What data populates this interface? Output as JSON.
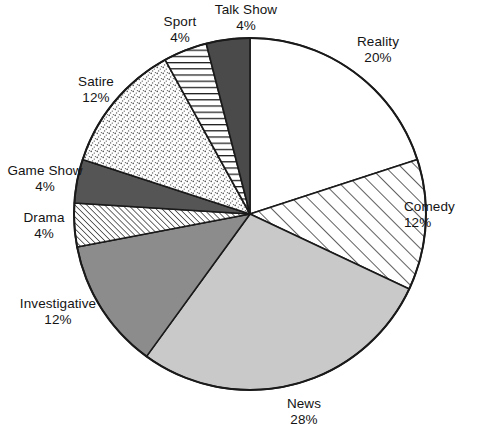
{
  "chart_data": {
    "type": "pie",
    "title": "",
    "subtitle": "",
    "xlabel": "",
    "ylabel": "",
    "legend_position": "none",
    "grid": false,
    "units": "%",
    "start_angle_deg": 0,
    "direction": "clockwise",
    "total": 100,
    "categories": [
      "Reality",
      "Comedy",
      "News",
      "Investigative",
      "Drama",
      "Game Show",
      "Satire",
      "Sport",
      "Talk Show"
    ],
    "values": [
      20,
      12,
      28,
      12,
      4,
      4,
      12,
      4,
      4
    ],
    "slices": [
      {
        "label": "Reality",
        "value": 20,
        "value_text": "20%",
        "fill": "#ffffff",
        "pattern": "solid-white",
        "start_deg": 0,
        "end_deg": 72
      },
      {
        "label": "Comedy",
        "value": 12,
        "value_text": "12%",
        "fill": "#ffffff",
        "pattern": "diagonal-hatch-wide",
        "start_deg": 72,
        "end_deg": 115.2
      },
      {
        "label": "News",
        "value": 28,
        "value_text": "28%",
        "fill": "#c9c9c9",
        "pattern": "solid-light-gray",
        "start_deg": 115.2,
        "end_deg": 216
      },
      {
        "label": "Investigative",
        "value": 12,
        "value_text": "12%",
        "fill": "#8c8c8c",
        "pattern": "solid-mid-gray",
        "start_deg": 216,
        "end_deg": 259.2
      },
      {
        "label": "Drama",
        "value": 4,
        "value_text": "4%",
        "fill": "#ffffff",
        "pattern": "diagonal-hatch-fine",
        "start_deg": 259.2,
        "end_deg": 273.6
      },
      {
        "label": "Game Show",
        "value": 4,
        "value_text": "4%",
        "fill": "#555555",
        "pattern": "solid-dark-gray",
        "start_deg": 273.6,
        "end_deg": 288
      },
      {
        "label": "Satire",
        "value": 12,
        "value_text": "12%",
        "fill": "#ffffff",
        "pattern": "stipple-dots",
        "start_deg": 288,
        "end_deg": 331.2
      },
      {
        "label": "Sport",
        "value": 4,
        "value_text": "4%",
        "fill": "#ffffff",
        "pattern": "horizontal-lines",
        "start_deg": 331.2,
        "end_deg": 345.6
      },
      {
        "label": "Talk Show",
        "value": 4,
        "value_text": "4%",
        "fill": "#4a4a4a",
        "pattern": "solid-dark-gray",
        "start_deg": 345.6,
        "end_deg": 360
      }
    ],
    "colors": {
      "outline": "#1a1a1a",
      "text": "#141414",
      "background": "#ffffff",
      "light_gray": "#c9c9c9",
      "mid_gray": "#8c8c8c",
      "dark_gray": "#555555",
      "darkest_gray": "#4a4a4a"
    },
    "geometry": {
      "center_x": 250,
      "center_y": 214,
      "radius": 176
    }
  },
  "labels": {
    "reality": {
      "name": "Reality",
      "value": "20%"
    },
    "comedy": {
      "name": "Comedy",
      "value": "12%"
    },
    "news": {
      "name": "News",
      "value": "28%"
    },
    "investigative": {
      "name": "Investigative",
      "value": "12%"
    },
    "drama": {
      "name": "Drama",
      "value": "4%"
    },
    "game_show": {
      "name": "Game Show",
      "value": "4%"
    },
    "satire": {
      "name": "Satire",
      "value": "12%"
    },
    "sport": {
      "name": "Sport",
      "value": "4%"
    },
    "talk_show": {
      "name": "Talk Show",
      "value": "4%"
    }
  }
}
